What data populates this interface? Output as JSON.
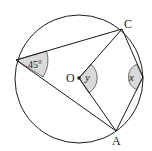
{
  "diagram": {
    "colors": {
      "stroke": "#1a1a1a",
      "angle_fill": "#d9d9d9",
      "background": "#ffffff"
    },
    "circle": {
      "cx": 79,
      "cy": 79,
      "r": 64
    },
    "points": {
      "P": {
        "x": 16,
        "y": 60
      },
      "C": {
        "x": 122,
        "y": 29
      },
      "O": {
        "x": 79,
        "y": 78
      },
      "B": {
        "x": 143,
        "y": 77
      },
      "A": {
        "x": 116,
        "y": 131
      }
    },
    "labels": {
      "C": "C",
      "O": "O",
      "A": "A",
      "angle_P": "45°",
      "angle_O": "y",
      "angle_B": "x"
    }
  }
}
